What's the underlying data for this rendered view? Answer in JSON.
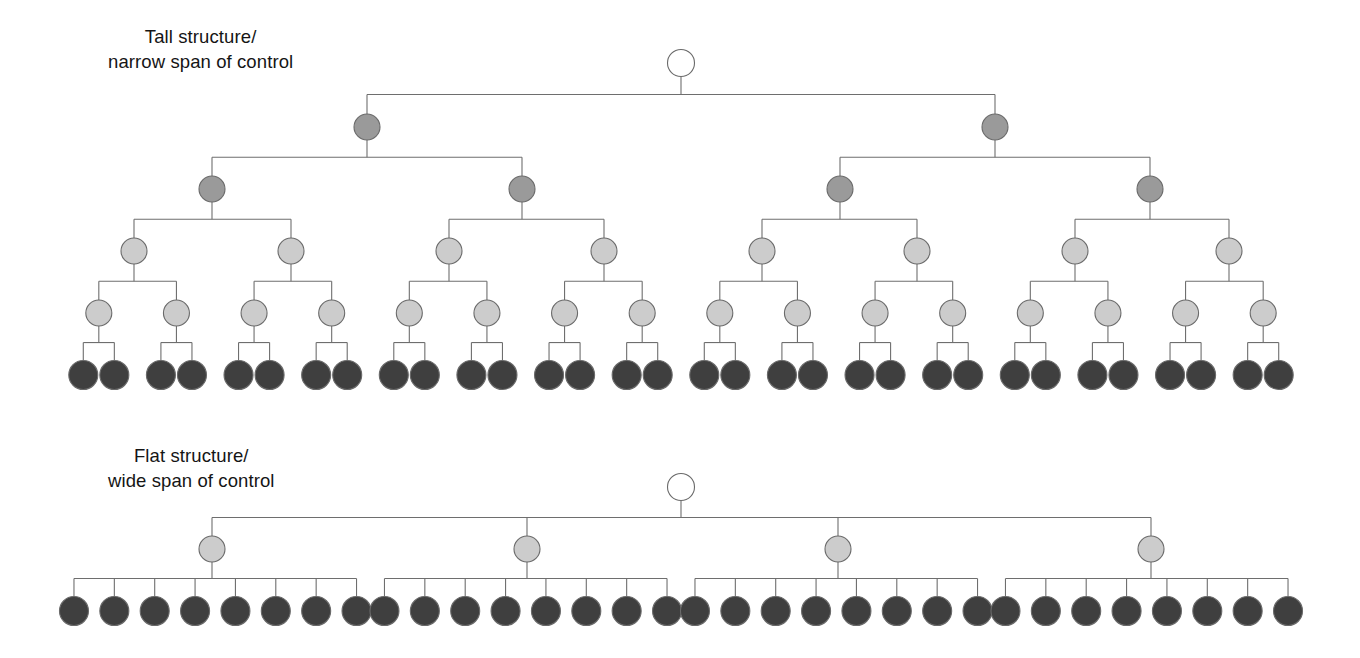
{
  "figure": {
    "title_tall_line1": "Tall structure/",
    "title_tall_line2": "narrow span of control",
    "title_flat_line1": "Flat structure/",
    "title_flat_line2": "wide span of control",
    "background_color": "#ffffff",
    "edge_color": "#6e6e6e",
    "text_color": "#151515"
  },
  "palette": {
    "root": "#ffffff",
    "level2": "#9a9a9a",
    "level3": "#9a9a9a",
    "level4": "#cccccc",
    "level5": "#cccccc",
    "leaf": "#3f3f3f",
    "stroke": "#6a6a6a"
  },
  "chart_data": {
    "type": "diagram",
    "subtype": "organizational-hierarchy-tree",
    "charts": [
      {
        "id": "tall-structure",
        "label_line1": "Tall structure/",
        "label_line2": "narrow span of control",
        "span_of_control": 2,
        "depth": 6,
        "total_nodes": 63,
        "levels": [
          {
            "level": 1,
            "name": "root",
            "count": 1,
            "fill": "#ffffff",
            "radius": 13.5,
            "y": 63
          },
          {
            "level": 2,
            "name": "senior-managers",
            "count": 2,
            "fill": "#9a9a9a",
            "radius": 13.0,
            "y": 127
          },
          {
            "level": 3,
            "name": "middle-managers",
            "count": 4,
            "fill": "#9a9a9a",
            "radius": 13.0,
            "y": 189
          },
          {
            "level": 4,
            "name": "supervisors",
            "count": 8,
            "fill": "#cccccc",
            "radius": 13.0,
            "y": 251
          },
          {
            "level": 5,
            "name": "team-leads",
            "count": 16,
            "fill": "#cccccc",
            "radius": 13.0,
            "y": 313
          },
          {
            "level": 6,
            "name": "workers",
            "count": 32,
            "fill": "#3f3f3f",
            "radius": 14.5,
            "y": 375
          }
        ]
      },
      {
        "id": "flat-structure",
        "label_line1": "Flat structure/",
        "label_line2": "wide span of control",
        "span_of_control": 8,
        "depth": 3,
        "total_nodes": 37,
        "levels": [
          {
            "level": 1,
            "name": "root",
            "count": 1,
            "fill": "#ffffff",
            "radius": 13.5,
            "y": 487
          },
          {
            "level": 2,
            "name": "managers",
            "count": 4,
            "fill": "#cccccc",
            "radius": 13.0,
            "y": 549
          },
          {
            "level": 3,
            "name": "workers",
            "count": 32,
            "fill": "#3f3f3f",
            "radius": 14.5,
            "y": 611
          }
        ]
      }
    ]
  }
}
